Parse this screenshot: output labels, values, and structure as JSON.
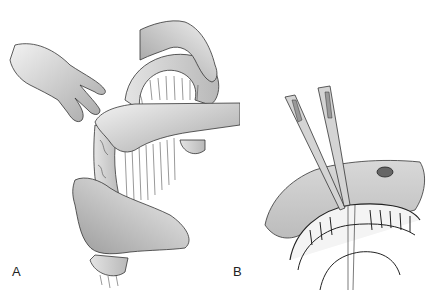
{
  "figure": {
    "panels": [
      {
        "id": "A",
        "label": "A",
        "description": "Hands manipulating bowel loop with mesentery (vessels) exposed"
      },
      {
        "id": "B",
        "label": "B",
        "description": "Two forceps/clamps applied to mesentery at bowel wall with vascular arcades"
      }
    ]
  },
  "colors": {
    "background": "#ffffff",
    "skin_light": "#e8e8e8",
    "skin_dark": "#9a9a9a",
    "line": "#2a2a2a",
    "tissue": "#c8c8c8"
  }
}
